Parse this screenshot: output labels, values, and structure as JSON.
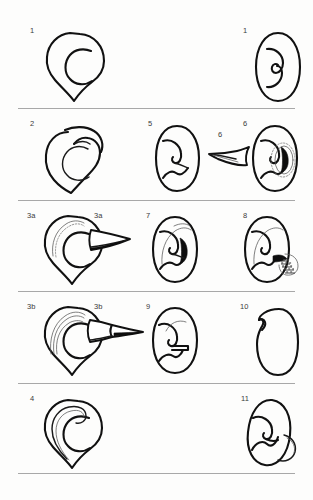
{
  "plate": {
    "title": "Ear morphology classification plate",
    "background_color": "#fdfdfc",
    "ink_color": "#111111",
    "rule_color": "#a8a8a8",
    "row_count": 5,
    "column_count": 3
  },
  "rows": [
    {
      "index": 1,
      "rule_y": 108,
      "figures": [
        {
          "label": "1",
          "column": "left",
          "caption": "ear outline, lateral view, stage 1"
        },
        {
          "label": "1",
          "column": "right",
          "caption": "ear outline, frontal view, stage 1"
        }
      ]
    },
    {
      "index": 2,
      "rule_y": 200,
      "figures": [
        {
          "label": "2",
          "column": "left",
          "caption": "ear outline with overhanging helix, stage 2"
        },
        {
          "label": "5",
          "column": "middle",
          "caption": "ear frontal view, stage 5"
        },
        {
          "label": "6",
          "column": "mid-right",
          "caption": "cartilage wedge, stage 6"
        },
        {
          "label": "6",
          "column": "right",
          "caption": "ear frontal view with concha detail, stage 6"
        }
      ]
    },
    {
      "index": 3,
      "rule_y": 291,
      "figures": [
        {
          "label": "3a",
          "column": "left",
          "caption": "ear outline with dotted helix rim, stage 3a"
        },
        {
          "label": "3a",
          "column": "mid-left",
          "caption": "cartilage wedge, stage 3a"
        },
        {
          "label": "7",
          "column": "middle",
          "caption": "ear frontal view, stage 7"
        },
        {
          "label": "8",
          "column": "right",
          "caption": "ear frontal view with stippled graft, stage 8"
        }
      ]
    },
    {
      "index": 4,
      "rule_y": 383,
      "figures": [
        {
          "label": "3b",
          "column": "left",
          "caption": "ear outline with multi-line helix rim, stage 3b"
        },
        {
          "label": "3b",
          "column": "mid-left",
          "caption": "cartilage wedge with extension, stage 3b"
        },
        {
          "label": "9",
          "column": "middle",
          "caption": "ear frontal view, stage 9"
        },
        {
          "label": "10",
          "column": "right",
          "caption": "plain ear outline, stage 10"
        }
      ]
    },
    {
      "index": 5,
      "rule_y": 473,
      "figures": [
        {
          "label": "4",
          "column": "left",
          "caption": "ear outline with inner helix fold, stage 4"
        },
        {
          "label": "11",
          "column": "right",
          "caption": "ear frontal view with lobule flap, stage 11"
        }
      ]
    }
  ],
  "labels": {
    "r1c1": "1",
    "r1c3": "1",
    "r2c1": "2",
    "r2c2": "5",
    "r2c2b": "6",
    "r2c3": "6",
    "r3c1": "3a",
    "r3c1b": "3a",
    "r3c2": "7",
    "r3c3": "8",
    "r4c1": "3b",
    "r4c1b": "3b",
    "r4c2": "9",
    "r4c3": "10",
    "r5c1": "4",
    "r5c3": "11"
  }
}
